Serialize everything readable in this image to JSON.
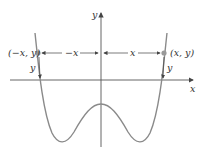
{
  "diagram": {
    "type": "even-function-symmetry",
    "axes": {
      "x_label": "x",
      "y_label": "y"
    },
    "points": [
      {
        "label": "(−x, y)",
        "side": "left"
      },
      {
        "label": "(x, y)",
        "side": "right"
      }
    ],
    "distances": {
      "left": "−x",
      "right": "x"
    },
    "heights": {
      "left": "y",
      "right": "y"
    },
    "colors": {
      "curve": "#8a8a8a",
      "axis": "#555555",
      "point": "#999999",
      "text": "#333333"
    }
  }
}
